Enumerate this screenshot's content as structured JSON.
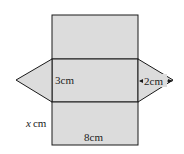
{
  "diagram": {
    "type": "net of triangular prism",
    "fill_color": "#dcdcdc",
    "stroke_color": "#1a1a1a",
    "labels": {
      "height": "3cm",
      "triangle_height": "2cm",
      "length_var": "x",
      "length_unit": "cm",
      "width": "8cm"
    }
  }
}
